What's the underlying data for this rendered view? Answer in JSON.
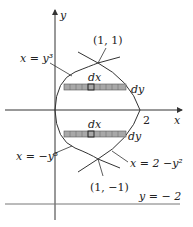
{
  "axes": {
    "x_label": "x",
    "y_label": "y",
    "x_tick": "2"
  },
  "curves": {
    "upper": "x = y³",
    "lower": "x = −y³",
    "parabola": "x =  2 −y²"
  },
  "points": {
    "top": "(1, 1)",
    "bottom": "(1, −1)"
  },
  "line": {
    "label": "y = − 2"
  },
  "strips": {
    "dx": "dx",
    "dy": "dy"
  },
  "colors": {
    "stroke": "#333333",
    "strip_fill": "#a8a8a8"
  }
}
